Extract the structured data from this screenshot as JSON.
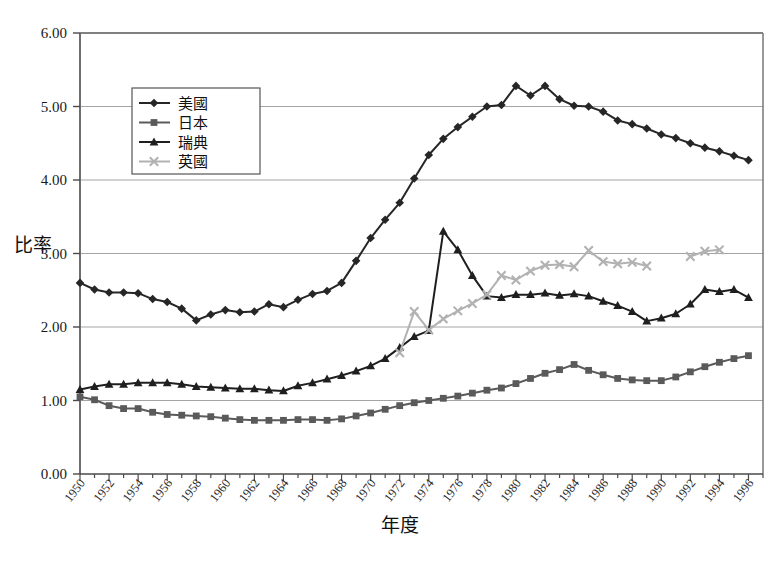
{
  "chart_data": {
    "type": "line",
    "title": "",
    "xlabel": "年度",
    "ylabel": "比率",
    "xlim": [
      1950,
      1997
    ],
    "ylim": [
      0.0,
      6.0
    ],
    "ytick_step": 1.0,
    "ytick_labels": [
      "0.00",
      "1.00",
      "2.00",
      "3.00",
      "4.00",
      "5.00",
      "6.00"
    ],
    "ytick_values": [
      0,
      1,
      2,
      3,
      4,
      5,
      6
    ],
    "xtick_labels": [
      "1950",
      "1952",
      "1954",
      "1956",
      "1958",
      "1960",
      "1962",
      "1964",
      "1966",
      "1968",
      "1970",
      "1972",
      "1974",
      "1976",
      "1978",
      "1980",
      "1982",
      "1984",
      "1986",
      "1988",
      "1990",
      "1992",
      "1994",
      "1996"
    ],
    "xtick_values": [
      1950,
      1952,
      1954,
      1956,
      1958,
      1960,
      1962,
      1964,
      1966,
      1968,
      1970,
      1972,
      1974,
      1976,
      1978,
      1980,
      1982,
      1984,
      1986,
      1988,
      1990,
      1992,
      1994,
      1996
    ],
    "minor_tick_step": 1,
    "grid": "horizontal",
    "legend_position": "upper-left-inside",
    "x": [
      1950,
      1951,
      1952,
      1953,
      1954,
      1955,
      1956,
      1957,
      1958,
      1959,
      1960,
      1961,
      1962,
      1963,
      1964,
      1965,
      1966,
      1967,
      1968,
      1969,
      1970,
      1971,
      1972,
      1973,
      1974,
      1975,
      1976,
      1977,
      1978,
      1979,
      1980,
      1981,
      1982,
      1983,
      1984,
      1985,
      1986,
      1987,
      1988,
      1989,
      1990,
      1991,
      1992,
      1993,
      1994,
      1995,
      1996
    ],
    "series": [
      {
        "name": "美國",
        "marker": "diamond",
        "color": "#262626",
        "values": [
          2.6,
          2.51,
          2.47,
          2.47,
          2.46,
          2.38,
          2.34,
          2.25,
          2.09,
          2.17,
          2.23,
          2.2,
          2.21,
          2.31,
          2.27,
          2.37,
          2.45,
          2.49,
          2.6,
          2.9,
          3.21,
          3.46,
          3.69,
          4.02,
          4.34,
          4.56,
          4.72,
          4.86,
          5.0,
          5.02,
          5.28,
          5.15,
          5.28,
          5.1,
          5.01,
          5.0,
          4.93,
          4.81,
          4.76,
          4.7,
          4.62,
          4.57,
          4.5,
          4.44,
          4.39,
          4.33,
          4.27
        ]
      },
      {
        "name": "日本",
        "marker": "square",
        "color": "#5a5a5a",
        "values": [
          1.05,
          1.01,
          0.93,
          0.89,
          0.89,
          0.84,
          0.81,
          0.8,
          0.79,
          0.78,
          0.76,
          0.74,
          0.73,
          0.73,
          0.73,
          0.74,
          0.74,
          0.73,
          0.75,
          0.79,
          0.83,
          0.88,
          0.93,
          0.97,
          1.0,
          1.03,
          1.06,
          1.1,
          1.14,
          1.17,
          1.23,
          1.3,
          1.37,
          1.42,
          1.49,
          1.41,
          1.35,
          1.3,
          1.28,
          1.27,
          1.27,
          1.32,
          1.39,
          1.46,
          1.52,
          1.57,
          1.61
        ]
      },
      {
        "name": "瑞典",
        "marker": "triangle",
        "color": "#1f1f1f",
        "values": [
          1.15,
          1.19,
          1.22,
          1.22,
          1.24,
          1.24,
          1.24,
          1.22,
          1.19,
          1.18,
          1.17,
          1.16,
          1.16,
          1.14,
          1.13,
          1.2,
          1.24,
          1.29,
          1.34,
          1.4,
          1.47,
          1.57,
          1.72,
          1.87,
          1.95,
          3.3,
          3.05,
          2.7,
          2.42,
          2.4,
          2.44,
          2.44,
          2.46,
          2.43,
          2.45,
          2.42,
          2.35,
          2.29,
          2.21,
          2.08,
          2.12,
          2.18,
          2.31,
          2.51,
          2.48,
          2.51,
          2.4
        ]
      },
      {
        "name": "英國",
        "marker": "cross",
        "color": "#b2b2b2",
        "values": [
          null,
          null,
          null,
          null,
          null,
          null,
          null,
          null,
          null,
          null,
          null,
          null,
          null,
          null,
          null,
          null,
          null,
          null,
          null,
          null,
          null,
          null,
          1.65,
          2.21,
          1.96,
          2.11,
          2.22,
          2.32,
          2.44,
          2.7,
          2.64,
          2.76,
          2.84,
          2.85,
          2.82,
          3.04,
          2.89,
          2.86,
          2.88,
          2.83,
          null,
          null,
          2.96,
          3.03,
          3.05,
          null,
          null
        ]
      }
    ]
  },
  "axes": {
    "ylabel": "比率",
    "xlabel": "年度"
  },
  "legend": {
    "items": [
      {
        "label": "美國",
        "marker": "diamond-icon",
        "color": "#262626"
      },
      {
        "label": "日本",
        "marker": "square-icon",
        "color": "#5a5a5a"
      },
      {
        "label": "瑞典",
        "marker": "triangle-icon",
        "color": "#1f1f1f"
      },
      {
        "label": "英國",
        "marker": "cross-icon",
        "color": "#b2b2b2"
      }
    ]
  }
}
